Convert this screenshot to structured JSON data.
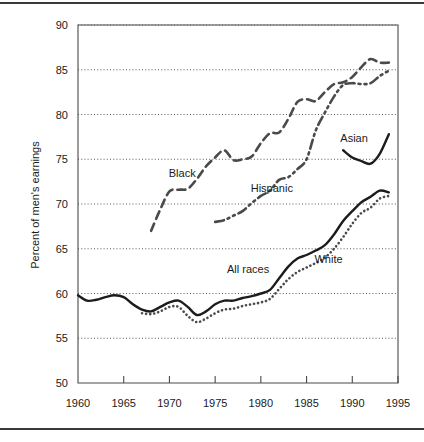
{
  "chart_data": {
    "type": "line",
    "title": "",
    "subtitle": "",
    "xlabel": "",
    "ylabel": "Percent of men's earnings",
    "xlim": [
      1960,
      1995
    ],
    "ylim": [
      50,
      90
    ],
    "grid": true,
    "grid_axis": "y",
    "legend_position": "inline-labels",
    "xticks": [
      1960,
      1965,
      1970,
      1975,
      1980,
      1985,
      1990,
      1995
    ],
    "yticks": [
      50,
      55,
      60,
      65,
      70,
      75,
      80,
      85,
      90
    ],
    "annotations": [
      {
        "text": "Black",
        "x": 1971.4,
        "y": 73.0
      },
      {
        "text": "Hispanic",
        "x": 1981.2,
        "y": 71.3
      },
      {
        "text": "Asian",
        "x": 1990.2,
        "y": 76.9
      },
      {
        "text": "All races",
        "x": 1978.6,
        "y": 62.3
      },
      {
        "text": "White",
        "x": 1987.4,
        "y": 63.4
      }
    ],
    "series": [
      {
        "name": "All races",
        "style": "solid",
        "color": "#1c1c1c",
        "x": [
          1960,
          1961,
          1962,
          1963,
          1964,
          1965,
          1966,
          1967,
          1968,
          1969,
          1970,
          1971,
          1972,
          1973,
          1974,
          1975,
          1976,
          1977,
          1978,
          1979,
          1980,
          1981,
          1982,
          1983,
          1984,
          1985,
          1986,
          1987,
          1988,
          1989,
          1990,
          1991,
          1992,
          1993,
          1994
        ],
        "values": [
          59.8,
          59.2,
          59.3,
          59.6,
          59.8,
          59.6,
          58.8,
          58.2,
          58.0,
          58.5,
          59.0,
          59.2,
          58.5,
          57.6,
          58.0,
          58.8,
          59.2,
          59.2,
          59.5,
          59.7,
          60.0,
          60.4,
          61.7,
          63.0,
          63.9,
          64.3,
          64.8,
          65.4,
          66.6,
          68.1,
          69.2,
          70.2,
          70.8,
          71.5,
          71.3
        ]
      },
      {
        "name": "White",
        "style": "dotted",
        "color": "#4a4a4a",
        "x": [
          1967,
          1968,
          1969,
          1970,
          1971,
          1972,
          1973,
          1974,
          1975,
          1976,
          1977,
          1978,
          1979,
          1980,
          1981,
          1982,
          1983,
          1984,
          1985,
          1986,
          1987,
          1988,
          1989,
          1990,
          1991,
          1992,
          1993,
          1994
        ],
        "values": [
          57.8,
          57.7,
          58.0,
          58.5,
          58.5,
          57.5,
          56.8,
          57.2,
          57.8,
          58.2,
          58.3,
          58.6,
          58.8,
          59.0,
          59.4,
          60.5,
          61.6,
          62.4,
          62.9,
          63.4,
          64.0,
          65.0,
          66.3,
          67.8,
          69.0,
          69.6,
          70.6,
          70.9
        ]
      },
      {
        "name": "Black",
        "style": "dashed",
        "color": "#4a4a4a",
        "x": [
          1968,
          1969,
          1970,
          1971,
          1972,
          1973,
          1974,
          1975,
          1976,
          1977,
          1978,
          1979,
          1980,
          1981,
          1982,
          1983,
          1984,
          1985,
          1986,
          1987,
          1988,
          1989,
          1990,
          1991,
          1992,
          1993,
          1994
        ],
        "values": [
          67.0,
          69.4,
          71.4,
          71.6,
          71.7,
          72.8,
          74.2,
          75.2,
          76.0,
          74.9,
          75.0,
          75.3,
          76.8,
          77.9,
          78.0,
          79.5,
          81.4,
          81.7,
          81.5,
          82.5,
          83.4,
          83.6,
          84.2,
          85.3,
          86.2,
          85.8,
          85.8
        ]
      },
      {
        "name": "Hispanic",
        "style": "dash-dot-dot",
        "color": "#4a4a4a",
        "x": [
          1975,
          1976,
          1977,
          1978,
          1979,
          1980,
          1981,
          1982,
          1983,
          1984,
          1985,
          1986,
          1987,
          1988,
          1989,
          1990,
          1991,
          1992,
          1993,
          1994
        ],
        "values": [
          68.0,
          68.2,
          68.7,
          69.2,
          70.1,
          70.9,
          71.5,
          72.7,
          73.0,
          73.9,
          75.0,
          78.2,
          80.2,
          82.0,
          83.3,
          83.5,
          83.4,
          83.5,
          84.3,
          84.9
        ]
      },
      {
        "name": "Asian",
        "style": "solid",
        "color": "#3b3b3b",
        "x": [
          1989,
          1990,
          1991,
          1992,
          1993,
          1994
        ],
        "values": [
          76.0,
          75.2,
          74.8,
          74.5,
          75.6,
          77.8
        ]
      }
    ]
  },
  "axes": {
    "y_title": "Percent of men's earnings",
    "y_tick_labels": [
      "90",
      "85",
      "80",
      "75",
      "70",
      "65",
      "60",
      "55",
      "50"
    ],
    "x_tick_labels": [
      "1960",
      "1965",
      "1970",
      "1975",
      "1980",
      "1985",
      "1990",
      "1995"
    ]
  }
}
